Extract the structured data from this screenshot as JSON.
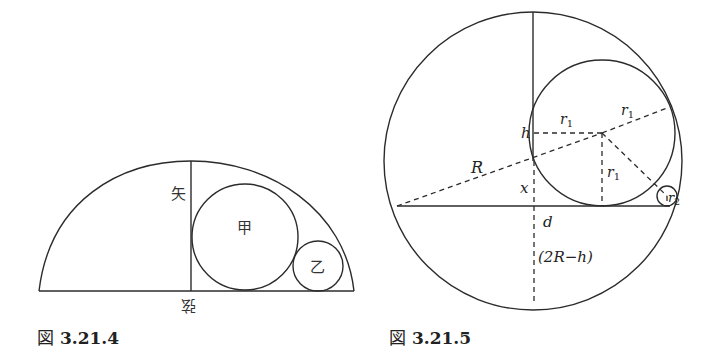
{
  "figures": [
    {
      "id": "fig-3-21-4",
      "caption_prefix": "図",
      "caption_number": "3.21.4",
      "labels": {
        "ya": "矢",
        "kou": "甲",
        "otsu": "乙",
        "gen": "弦"
      },
      "geometry": {
        "chord": {
          "x1": 39,
          "x2": 354,
          "y": 291
        },
        "arc_apex": {
          "x": 191,
          "y": 161
        },
        "sagitta_x": 191,
        "circle_kou": {
          "cx": 245,
          "cy": 237,
          "r": 53
        },
        "circle_otsu": {
          "cx": 318,
          "cy": 266,
          "r": 25
        }
      }
    },
    {
      "id": "fig-3-21-5",
      "caption_prefix": "図",
      "caption_number": "3.21.5",
      "labels": {
        "h": "h",
        "r1_a": "r",
        "r1_b": "r",
        "r1_c": "r",
        "r1_sub": "1",
        "R": "R",
        "x": "x",
        "r2": "r",
        "r2_sub": "2",
        "d": "d",
        "two_R_minus_h": "(2R−h)"
      },
      "geometry": {
        "outer_circle": {
          "cx": 533,
          "cy": 161,
          "r": 149
        },
        "chord_y": 206,
        "circle_r1": {
          "cx": 602,
          "cy": 133,
          "r": 73
        },
        "circle_r2": {
          "cx": 667,
          "cy": 196,
          "r": 10
        }
      }
    }
  ]
}
